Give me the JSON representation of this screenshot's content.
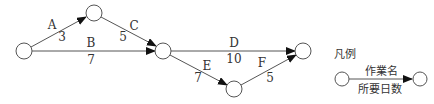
{
  "diagram": {
    "type": "arrow-diagram",
    "nodes": [
      {
        "id": "1",
        "cx": 24,
        "cy": 51
      },
      {
        "id": "2",
        "cx": 94,
        "cy": 13
      },
      {
        "id": "3",
        "cx": 163,
        "cy": 51
      },
      {
        "id": "4",
        "cx": 234,
        "cy": 89
      },
      {
        "id": "5",
        "cx": 303,
        "cy": 51
      }
    ],
    "edges": [
      {
        "activity": "A",
        "days": "3",
        "from": "1",
        "to": "2"
      },
      {
        "activity": "B",
        "days": "7",
        "from": "1",
        "to": "3"
      },
      {
        "activity": "C",
        "days": "5",
        "from": "2",
        "to": "3"
      },
      {
        "activity": "D",
        "days": "10",
        "from": "3",
        "to": "5"
      },
      {
        "activity": "E",
        "days": "7",
        "from": "3",
        "to": "4"
      },
      {
        "activity": "F",
        "days": "5",
        "from": "4",
        "to": "5"
      }
    ]
  },
  "legend": {
    "title": "凡例",
    "activity_label": "作業名",
    "days_label": "所要日数"
  }
}
